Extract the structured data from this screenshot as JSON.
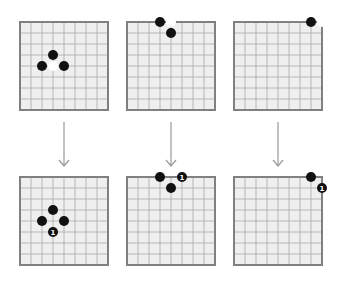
{
  "diagram": {
    "grid_cells": 8,
    "colors": {
      "board": "#efefef",
      "line": "#a8a8a8",
      "border": "#808080",
      "black": "#111111",
      "white": "#ffffff",
      "arrow": "#999999"
    },
    "panels": [
      {
        "name": "center",
        "before": {
          "black": [
            [
              3,
              3
            ],
            [
              2,
              4
            ],
            [
              4,
              4
            ]
          ],
          "white": [
            [
              3,
              4
            ]
          ]
        },
        "after": {
          "black": [
            [
              3,
              3
            ],
            [
              2,
              4
            ],
            [
              4,
              4
            ],
            [
              3,
              5
            ]
          ],
          "numbered": {
            "pos": [
              3,
              5
            ],
            "label": "1"
          }
        }
      },
      {
        "name": "edge",
        "before": {
          "black": [
            [
              3,
              0
            ],
            [
              4,
              1
            ]
          ],
          "white": [
            [
              4,
              0
            ]
          ]
        },
        "after": {
          "black": [
            [
              3,
              0
            ],
            [
              4,
              1
            ],
            [
              5,
              0
            ]
          ],
          "numbered": {
            "pos": [
              5,
              0
            ],
            "label": "1"
          }
        }
      },
      {
        "name": "corner",
        "before": {
          "black": [
            [
              7,
              0
            ]
          ],
          "white": [
            [
              8,
              0
            ]
          ]
        },
        "after": {
          "black": [
            [
              7,
              0
            ],
            [
              8,
              1
            ]
          ],
          "numbered": {
            "pos": [
              8,
              1
            ],
            "label": "1"
          }
        }
      }
    ],
    "move_label": "1"
  }
}
